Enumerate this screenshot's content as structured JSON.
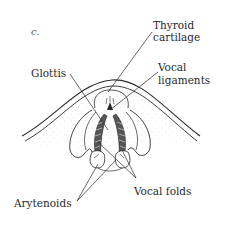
{
  "figure": {
    "panel_label": "c.",
    "labels": {
      "thyroid_line1": "Thyroid",
      "thyroid_line2": "cartilage",
      "vocal_lig_line1": "Vocal",
      "vocal_lig_line2": "ligaments",
      "glottis": "Glottis",
      "vocal_folds": "Vocal folds",
      "arytenoids": "Arytenoids"
    },
    "colors": {
      "ink": "#2a2a2a",
      "background": "#ffffff",
      "stipple": "#b8b8b8"
    }
  }
}
